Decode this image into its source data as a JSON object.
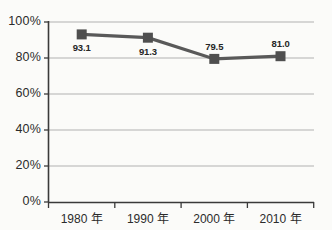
{
  "chart_data": {
    "type": "line",
    "title": "",
    "subtitle": "",
    "xlabel": "",
    "ylabel": "",
    "categories": [
      "1980 年",
      "1990 年",
      "2000 年",
      "2010 年"
    ],
    "values": [
      93.1,
      91.3,
      79.5,
      81.0
    ],
    "point_labels": [
      "93.1",
      "91.3",
      "79.5",
      "81.0"
    ],
    "point_label_positions": [
      "below",
      "below",
      "above",
      "above"
    ],
    "ylim": [
      0,
      100
    ],
    "ytick_values": [
      0,
      20,
      40,
      60,
      80,
      100
    ],
    "ytick_labels": [
      "0%",
      "20%",
      "40%",
      "60%",
      "80%",
      "100%"
    ],
    "xtick_labels": [
      "1980 年",
      "1990 年",
      "2000 年",
      "2010 年"
    ],
    "grid": true,
    "grid_axis": "y",
    "legend": false,
    "legend_position": "none",
    "marker": "square",
    "series": [
      {
        "name": "",
        "values": [
          93.1,
          91.3,
          79.5,
          81.0
        ]
      }
    ],
    "colors": {
      "line": "#595959",
      "marker": "#4f4f4f",
      "gridline": "#b2b2b2",
      "axis": "#3a3a3a",
      "text": "#2b2b2b",
      "background": "#fbfbf9"
    }
  }
}
